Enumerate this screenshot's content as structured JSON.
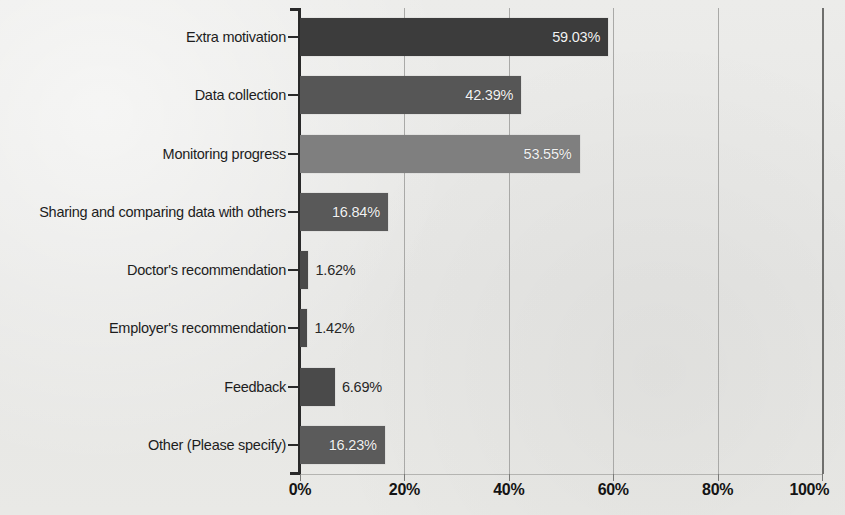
{
  "chart_data": {
    "type": "bar",
    "orientation": "horizontal",
    "title": "",
    "xlabel": "",
    "ylabel": "",
    "xlim": [
      0,
      100
    ],
    "grid": true,
    "legend": null,
    "categories": [
      "Extra motivation",
      "Data collection",
      "Monitoring progress",
      "Sharing and comparing data with others",
      "Doctor's recommendation",
      "Employer's recommendation",
      "Feedback",
      "Other (Please specify)"
    ],
    "values": [
      59.03,
      42.39,
      53.55,
      16.84,
      1.62,
      1.42,
      6.69,
      16.23
    ],
    "value_labels": [
      "59.03%",
      "42.39%",
      "53.55%",
      "16.84%",
      "1.62%",
      "1.42%",
      "6.69%",
      "16.23%"
    ],
    "label_placement": [
      "inside",
      "inside",
      "inside",
      "inside",
      "outside",
      "outside",
      "outside",
      "inside"
    ],
    "bar_colors": [
      "#3c3c3c",
      "#565656",
      "#7f7f7f",
      "#595959",
      "#4a4a4a",
      "#4a4a4a",
      "#4a4a4a",
      "#5b5b5b"
    ],
    "xticks": [
      0,
      20,
      40,
      60,
      80,
      100
    ],
    "xtick_labels": [
      "0%",
      "20%",
      "40%",
      "60%",
      "80%",
      "100%"
    ]
  },
  "style": {
    "background": "#e9e9e7",
    "axis_color": "#2a2a2a",
    "grid_color": "#a9a9a7",
    "inside_label_color": "#f2f2f2",
    "outside_label_color": "#272727"
  }
}
